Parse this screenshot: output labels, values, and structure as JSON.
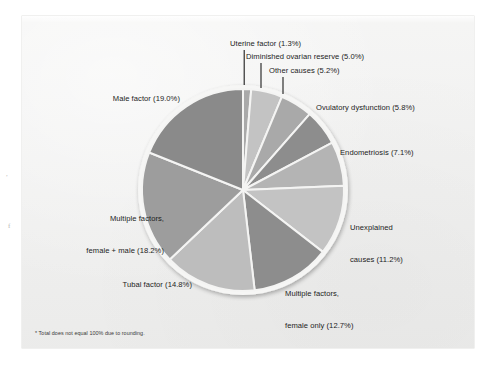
{
  "figure": {
    "footnote": "* Total does not equal 100% due to rounding.",
    "background_color": "#f0f0ef",
    "page_color": "#ffffff",
    "text_color": "#1c1c1c"
  },
  "chart_data": {
    "type": "pie",
    "title": "",
    "subtitle": "",
    "xlabel": "",
    "ylabel": "",
    "legend_position": "callout-labels",
    "grid": false,
    "units": "percent",
    "note": "* Total does not equal 100% due to rounding.",
    "start_angle_deg": 0,
    "direction": "clockwise",
    "categories": [
      "Uterine factor",
      "Diminished ovarian reserve",
      "Other causes",
      "Ovulatory dysfunction",
      "Endometriosis",
      "Unexplained causes",
      "Multiple factors, female only",
      "Tubal factor",
      "Multiple factors, female + male",
      "Male factor"
    ],
    "values": [
      1.3,
      5.0,
      5.2,
      5.8,
      7.1,
      11.2,
      12.7,
      14.8,
      18.2,
      19.0
    ],
    "colors": [
      "#a9a9a9",
      "#c3c3c3",
      "#a9a9a9",
      "#8d8d8d",
      "#b4b4b4",
      "#c3c3c3",
      "#8d8d8d",
      "#bdbdbd",
      "#9d9d9d",
      "#8a8a8a"
    ],
    "slices": [
      {
        "label": "Uterine factor",
        "value": 1.3,
        "display": "Uterine factor (1.3%)",
        "color": "#a9a9a9"
      },
      {
        "label": "Diminished ovarian reserve",
        "value": 5.0,
        "display": "Diminished ovarian reserve (5.0%)",
        "color": "#c3c3c3"
      },
      {
        "label": "Other causes",
        "value": 5.2,
        "display": "Other causes (5.2%)",
        "color": "#a9a9a9"
      },
      {
        "label": "Ovulatory dysfunction",
        "value": 5.8,
        "display": "Ovulatory dysfunction (5.8%)",
        "color": "#8d8d8d"
      },
      {
        "label": "Endometriosis",
        "value": 7.1,
        "display": "Endometriosis (7.1%)",
        "color": "#b4b4b4"
      },
      {
        "label": "Unexplained causes",
        "value": 11.2,
        "display": "Unexplained causes (11.2%)",
        "color": "#c3c3c3"
      },
      {
        "label": "Multiple factors, female only",
        "value": 12.7,
        "display": "Multiple factors, female only (12.7%)",
        "color": "#8d8d8d"
      },
      {
        "label": "Tubal factor",
        "value": 14.8,
        "display": "Tubal factor (14.8%)",
        "color": "#bdbdbd"
      },
      {
        "label": "Multiple factors, female + male",
        "value": 18.2,
        "display": "Multiple factors, female + male (18.2%)",
        "color": "#9d9d9d"
      },
      {
        "label": "Male factor",
        "value": 19.0,
        "display": "Male factor (19.0%)",
        "color": "#8a8a8a"
      }
    ]
  },
  "labels": {
    "uterine_factor": "Uterine factor (1.3%)",
    "diminished_ovarian_reserve": "Diminished ovarian reserve (5.0%)",
    "other_causes": "Other causes (5.2%)",
    "ovulatory_dysfunction": "Ovulatory dysfunction (5.8%)",
    "endometriosis": "Endometriosis (7.1%)",
    "unexplained_causes_l1": "Unexplained",
    "unexplained_causes_l2": "causes (11.2%)",
    "multiple_female_only_l1": "Multiple factors,",
    "multiple_female_only_l2": "female only (12.7%)",
    "tubal_factor": "Tubal factor (14.8%)",
    "multiple_female_male_l1": "Multiple factors,",
    "multiple_female_male_l2": "female + male (18.2%)",
    "male_factor": "Male factor (19.0%)"
  }
}
